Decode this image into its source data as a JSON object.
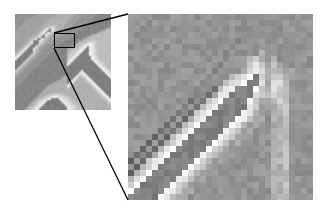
{
  "figure": {
    "type": "scientific-micrograph-figure",
    "background_color": "#ffffff",
    "width": 321,
    "height": 214
  },
  "overview_panel": {
    "name": "overview-image",
    "label": "",
    "x": 15,
    "y": 14,
    "width": 96,
    "height": 96,
    "background_color": "#8a8a8a",
    "bright_color": "#e6e4e0",
    "dark_color": "#3a3a3a",
    "grid_cols": 48,
    "grid_rows": 48,
    "pixels": [
      "888888888889999999999aaaaaaaa99999888888877777777",
      "888888889999999999aaaaaaaaaa999988888887777777777",
      "88888899999999999aaaaaaaaaaa99998888888777777777a",
      "8888899999999999aaaaaaaaaaa999988888887777777777b",
      "888899999999999aaaaaaaaaaa9999888888877777777777b",
      "88899999999999aaaaabaaaaa99998888888777777777777b",
      "8899999999999aaabddcbaaa99998888887777777777777ab",
      "899999999999aabdfgfdbaa9999888888777777777777aabb",
      "99999999999aabdfhgecba999988888877777777777aabbbb",
      "9999999999aabdfgfdbaa99998888887777777777aabbbbbb",
      "999999999aabcegfdba9999888888777777777aabbbbbbbbb",
      "99999999aabdfhgdba999988888877777777aabbbbbbbbbbb",
      "9999999abdfhgfcba99998888887777777aabbbbbbbbbbbbb",
      "999999abdgjifdba9998888887777777aabbbcccbbbbbbbbb",
      "99999abcfiihecb9998888887777777abbbcdeedcbbbbbbbb",
      "9999abcehhgdba9988888877777777abbcdeffedcbbbbbbbb",
      "999abdfhigeca998888887777777aabbcdefgfedcbbbbbbbb",
      "99abdfijhfca99888888777777aabbccdefggfedcbbbbbbbb",
      "9abdfhjjgdba98888887777777abbccdefghgfedcbbbbbbbb",
      "abdfhjkigdb998888877777777abccdefghhgfedcbbbbbbbb",
      "bdfhjkjgdb9988888777777777bccdefghihgfedcbbbbbbbb",
      "dfhjkjhdb99888887777777777bcdefghijihgfedcbbbbbbb",
      "fhjkjhdb998888877777777777cdefghijjihgfedcbbbbbbb",
      "hjkjgdb9988888777777777777defghijkjjihgfedcbbbbbb",
      "jkjgdb99888887777777777777efghijkkkjjihgfedcbbbbb",
      "kjgdb998888877777777777777fghijkkkkkjjihgfedcbbbb",
      "jgdb9988888777777777777777ghijkkjkkkkjjihgfedcbbb",
      "gdb99888887777777777777777hijkkjihjkkkjjihgfedcbb",
      "db998888877777777777777777ijkkjhgfhjkkkjjihgfedcb",
      "b9988888777777777777777777jkkjhgeefhjkkkjjihgfedc",
      "99888887777777777777777777kkjhgedcefhjkkkjjihgfed",
      "988888777777777777777777aakjhgedbbcefhjkkkjjihgfe",
      "88888777777777777777777aaajhgedbaabcefhjkkkjjihgf",
      "888877777777777777777aaaaahgedbaaaabcefhjkkkjjihg",
      "8887777777777777777aaaaaaagedbaaaaaabcefhjkkkjjih",
      "88777777777777777aaaaaaaaaedbaaaaaaaabcefhjkkkjji",
      "8777777777777777aaaaaaaaaadbaaaaaaaaaabcefhjkkkjj",
      "777777777777777aaaaaaaaaaabaaaaaaaaaaaabcefhjkkkj",
      "77777777777777aaaaaaaaaaaaaaaaaaaaaaaaaabcefhjkkk",
      "7777777777777aaaaaabbbbbaaaaaaaaaaaaaaaaabcefhjkk",
      "777777777777aaaabbccddccbbaaaaaaaaaaaaaaaabcefhjk",
      "77777777777aaabbcdeffeedccbbaaaaaaaaaaaaaaabcefhj",
      "7777777777aabbcdefghhgfeddcbbaaaaaaaaaaaaaaabcefh",
      "777777777aabcdefghiihhgfeddcbbaaaaaaaaaaaaaaabcef",
      "77777777aabcdefghijjiihgfeddcbbaaaaaaaaaaaaaaabcd",
      "7777777aabcdefghijjjjiihgfeddcbbaaaaaaaaaaaaaaabc",
      "777777aabcdefghiijjjjjiihgfeddcbbaaaaaaaaaaaaaaab",
      "77777aabcdefghiijjjjjjiihgfeddcbbaaaaaaaaaaaaaaaa"
    ]
  },
  "detail_panel": {
    "name": "magnified-roi-image",
    "label": "",
    "x": 128,
    "y": 14,
    "width": 185,
    "height": 186,
    "background_color": "#8a8a8a",
    "bright_color": "#f2f0ec",
    "dark_color": "#2a2a2a",
    "grid_cols": 31,
    "grid_rows": 31,
    "block_size_px": 6,
    "pixels": [
      "8888888888888888888888888888888",
      "8888888888888888888888888888888",
      "8888888888888888888888888888888",
      "8888888888888888888888888888888",
      "8888888888888888887888888888888",
      "8888888888888888878888988888888",
      "8888888888888888788898a98888888",
      "88888888888888887888aca9a888888",
      "88888888888888778888cec9ba98888",
      "8888888888888878888acfcabba9888",
      "88888888888887888acdfhdacba9888",
      "8888888888887788bcdfjhe9ddb8888",
      "888888888887785bdfhjjfcadcb8888",
      "88888888888785adfhjjgdbbcbb8888",
      "8888888888685bdfhjjhfca9bcb8888",
      "888888888685adfhjjhgec99abb8888",
      "88888888685bdfhjihgfda98aab8888",
      "8888888585adfhjihgfec998aab8888",
      "888888585bdfhjihgfdb9988aab8888",
      "88888585adfhjihgfdb99888aab8888",
      "8888585bdfhjihgfdb998888aab8888",
      "888585adfhjihgfdb9988888aab8888",
      "88585bdfhjihgfdb99888888aab8888",
      "8585adfhjihgfdb998888888aab8888",
      "585bdfhjihgfdb9988888888aab8888",
      "85adfhjihgfdb99888888888aab8888",
      "5bdfhjihgfdb998888888888aab8888",
      "adfhjihgfdb9988888888888aab8888",
      "dfhjihgfdb99888888888888aab8888",
      "fhjihgfdb998888888888888aab8888",
      "hjihgfdb9988888888888888aab8888"
    ]
  },
  "roi_box": {
    "name": "roi-rectangle",
    "x": 54,
    "y": 33,
    "width": 21,
    "height": 15,
    "stroke_color": "#000000",
    "stroke_width": 1.5
  },
  "connectors": [
    {
      "name": "upper-leader-line",
      "from": [
        54,
        33
      ],
      "to": [
        128,
        14
      ],
      "stroke_color": "#000000",
      "stroke_width": 1.3
    },
    {
      "name": "lower-leader-line",
      "from": [
        54,
        48
      ],
      "to": [
        128,
        200
      ],
      "stroke_color": "#000000",
      "stroke_width": 1.3
    }
  ]
}
